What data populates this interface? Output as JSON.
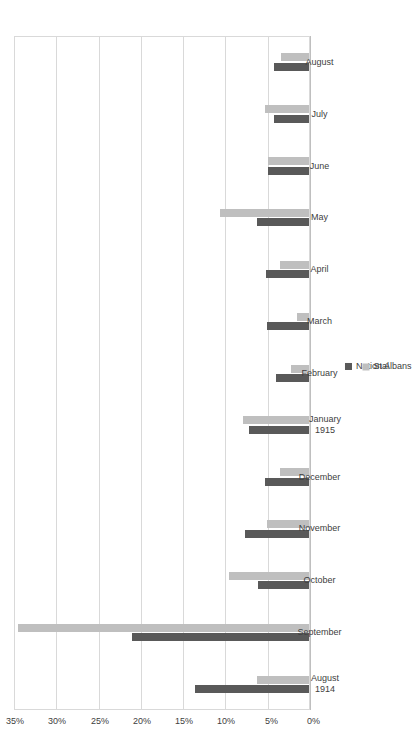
{
  "chart_data": {
    "type": "bar",
    "orientation": "horizontal",
    "title": "",
    "subtitle": "",
    "xlabel": "",
    "ylabel": "",
    "xlim": [
      0,
      35
    ],
    "axis_tick_labels": [
      "35%",
      "30%",
      "25%",
      "20%",
      "15%",
      "10%",
      "5%",
      "0%"
    ],
    "axis_tick_values": [
      35,
      30,
      25,
      20,
      15,
      10,
      5,
      0
    ],
    "axis_direction": "right-to-left",
    "grid": true,
    "legend_position": "bottom",
    "categories": [
      "August\n1914",
      "September",
      "October",
      "November",
      "December",
      "January\n1915",
      "February",
      "March",
      "April",
      "May",
      "June",
      "July",
      "August"
    ],
    "category_lines": [
      [
        "August",
        "1914"
      ],
      [
        "September"
      ],
      [
        "October"
      ],
      [
        "November"
      ],
      [
        "December"
      ],
      [
        "January",
        "1915"
      ],
      [
        "February"
      ],
      [
        "March"
      ],
      [
        "April"
      ],
      [
        "May"
      ],
      [
        "June"
      ],
      [
        "July"
      ],
      [
        "August"
      ]
    ],
    "series": [
      {
        "name": "National",
        "color": "#595959",
        "values": [
          13.6,
          21.0,
          6.2,
          7.7,
          5.3,
          7.2,
          4.0,
          5.1,
          5.2,
          6.3,
          5.0,
          4.2,
          4.3
        ]
      },
      {
        "name": "St Albans",
        "color": "#bfbfbf",
        "values": [
          6.3,
          34.5,
          9.6,
          5.1,
          3.6,
          7.9,
          2.3,
          1.5,
          3.5,
          10.7,
          5.0,
          5.3,
          3.4
        ]
      }
    ]
  },
  "legend": {
    "items": [
      {
        "label": "National",
        "color": "#595959"
      },
      {
        "label": "St Albans",
        "color": "#bfbfbf"
      }
    ]
  },
  "colors": {
    "national": "#595959",
    "st_albans": "#bfbfbf",
    "gridline": "#d9d9d9",
    "text": "#404040",
    "background": "#ffffff"
  }
}
